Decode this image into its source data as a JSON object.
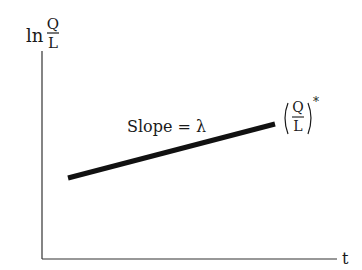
{
  "diagram": {
    "y_axis": {
      "prefix": "ln",
      "numerator": "Q",
      "denominator": "L"
    },
    "x_axis": {
      "label": "t"
    },
    "line": {
      "label": "Slope = λ",
      "x1": 68,
      "y1": 178,
      "x2": 275,
      "y2": 124
    },
    "end_label": {
      "numerator": "Q",
      "denominator": "L",
      "superscript": "*"
    },
    "colors": {
      "ink": "#1a1a1a",
      "background": "#ffffff"
    }
  }
}
